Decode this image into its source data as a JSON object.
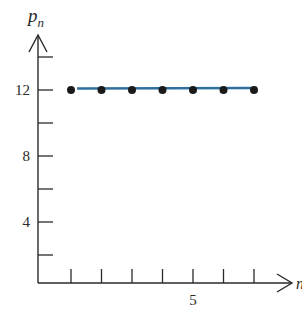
{
  "chart_data": {
    "type": "scatter",
    "title": "",
    "xlabel": "n",
    "ylabel": "p_n",
    "ylabel_base": "p",
    "ylabel_sub": "n",
    "x": [
      1,
      2,
      3,
      4,
      5,
      6,
      7
    ],
    "series": [
      {
        "name": "p_n",
        "values": [
          12,
          12,
          12,
          12,
          12,
          12,
          12
        ],
        "marker": "dot",
        "color": "#1a1a1a"
      }
    ],
    "reference_line": {
      "y": 12,
      "x_range": [
        1.2,
        7.1
      ],
      "color": "#2f6f9f"
    },
    "xlim": [
      0,
      7.8
    ],
    "ylim": [
      0,
      15
    ],
    "x_ticks": [
      1,
      2,
      3,
      4,
      5,
      6,
      7
    ],
    "x_tick_labels": [
      {
        "value": 5,
        "label": "5"
      }
    ],
    "y_ticks": [
      2,
      4,
      6,
      8,
      10,
      12,
      14
    ],
    "y_tick_labels": [
      {
        "value": 4,
        "label": "4"
      },
      {
        "value": 8,
        "label": "8"
      },
      {
        "value": 12,
        "label": "12"
      }
    ],
    "grid": false,
    "legend": "none"
  }
}
